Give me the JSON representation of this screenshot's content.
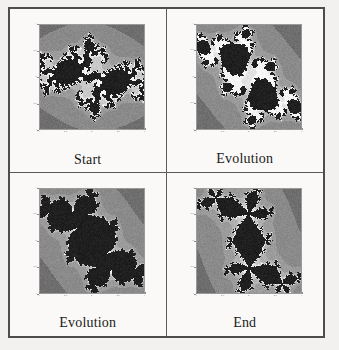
{
  "figure": {
    "kind": "fractal-panel-figure",
    "layout": {
      "rows": 2,
      "cols": 2
    },
    "background_color": "#faf9f7",
    "border_color": "#4d4d4d"
  },
  "panels": [
    {
      "id": "start",
      "caption": "Start",
      "axis": {
        "xticks": [
          "-1",
          "-0.5",
          "0",
          "0.5",
          "1"
        ],
        "yticks": [
          "1",
          "0.5",
          "0",
          "-0.5",
          "-1"
        ],
        "xlim": [
          -1,
          1
        ],
        "ylim": [
          -1,
          1
        ]
      }
    },
    {
      "id": "evolution-1",
      "caption": "Evolution",
      "axis": {
        "xticks": [
          "-1",
          "-0.5",
          "0",
          "0.5",
          "1"
        ],
        "yticks": [
          "1",
          "0.5",
          "0",
          "-0.5",
          "-1"
        ],
        "xlim": [
          -1,
          1
        ],
        "ylim": [
          -1,
          1
        ]
      }
    },
    {
      "id": "evolution-2",
      "caption": "Evolution",
      "axis": {
        "xticks": [
          "-1",
          "-0.5",
          "0",
          "0.5",
          "1"
        ],
        "yticks": [
          "1",
          "0.5",
          "0",
          "-0.5",
          "-1"
        ],
        "xlim": [
          -1,
          1
        ],
        "ylim": [
          -1,
          1
        ]
      }
    },
    {
      "id": "end",
      "caption": "End",
      "axis": {
        "xticks": [
          "-1",
          "-0.5",
          "0",
          "0.5",
          "1"
        ],
        "yticks": [
          "1",
          "0.5",
          "0",
          "-0.5",
          "-1"
        ],
        "xlim": [
          -1,
          1
        ],
        "ylim": [
          -1,
          1
        ]
      }
    }
  ],
  "chart_data": {
    "type": "heatmap",
    "title": "",
    "xlabel": "",
    "ylabel": "",
    "grid": false,
    "legend": "none",
    "colormap_grays": [
      "#1f1f1f",
      "#3a3a3a",
      "#565656",
      "#6e6e6e",
      "#8a8a8a",
      "#9b9b9b",
      "#b0b0b0",
      "#c8c8c8",
      "#e2e2e2",
      "#f5f5f5"
    ],
    "panels": [
      {
        "name": "Start",
        "render": "julia",
        "c": [
          -0.74,
          0.18
        ],
        "max_iter": 42,
        "escape_radius": 2.2,
        "xlim": [
          -1,
          1
        ],
        "ylim": [
          -1,
          1
        ],
        "xticks": [
          -1,
          -0.5,
          0,
          0.5,
          1
        ],
        "yticks": [
          -1,
          -0.5,
          0,
          0.5,
          1
        ],
        "seed": 11
      },
      {
        "name": "Evolution",
        "render": "julia",
        "c": [
          -0.19,
          0.655
        ],
        "max_iter": 40,
        "escape_radius": 2.2,
        "xlim": [
          -1,
          1
        ],
        "ylim": [
          -1,
          1
        ],
        "xticks": [
          -1,
          -0.5,
          0,
          0.5,
          1
        ],
        "yticks": [
          -1,
          -0.5,
          0,
          0.5,
          1
        ],
        "seed": 23
      },
      {
        "name": "Evolution",
        "render": "julia",
        "c": [
          -0.105,
          0.655
        ],
        "max_iter": 40,
        "escape_radius": 2.2,
        "xlim": [
          -1,
          1
        ],
        "ylim": [
          -1,
          1
        ],
        "xticks": [
          -1,
          -0.5,
          0,
          0.5,
          1
        ],
        "yticks": [
          -1,
          -0.5,
          0,
          0.5,
          1
        ],
        "seed": 37
      },
      {
        "name": "End",
        "render": "julia",
        "c": [
          0.285,
          0.535
        ],
        "max_iter": 40,
        "escape_radius": 2.2,
        "xlim": [
          -1,
          1
        ],
        "ylim": [
          -1,
          1
        ],
        "xticks": [
          -1,
          -0.5,
          0,
          0.5,
          1
        ],
        "yticks": [
          -1,
          -0.5,
          0,
          0.5,
          1
        ],
        "seed": 51
      }
    ]
  }
}
